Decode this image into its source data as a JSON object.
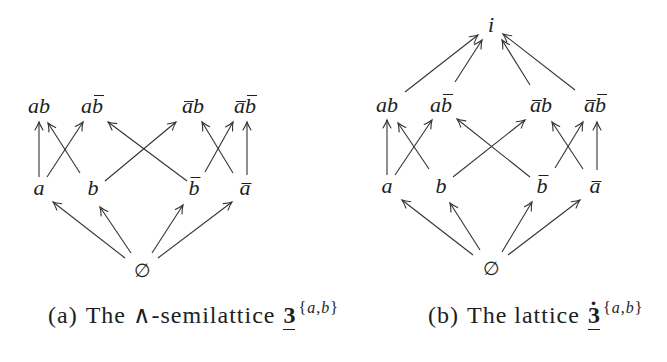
{
  "subfigures": [
    {
      "caption": {
        "tag": "(a)",
        "text": "The ∧-semilattice",
        "symbol": "3",
        "symbol_style": "bold, underlined",
        "superscript": [
          "{",
          "a",
          ",",
          "b",
          "}"
        ]
      },
      "nodes": {
        "ab": {
          "label": "ab",
          "parts": [
            "a",
            "b"
          ],
          "overline": [
            false,
            false
          ]
        },
        "a_bbar": {
          "label": "ab̄",
          "parts": [
            "a",
            "b"
          ],
          "overline": [
            false,
            true
          ]
        },
        "abar_b": {
          "label": "āb",
          "parts": [
            "a",
            "b"
          ],
          "overline": [
            true,
            false
          ]
        },
        "abar_bbar": {
          "label": "āb̄",
          "parts": [
            "a",
            "b"
          ],
          "overline": [
            true,
            true
          ]
        },
        "a": {
          "label": "a",
          "parts": [
            "a"
          ],
          "overline": [
            false
          ]
        },
        "b": {
          "label": "b",
          "parts": [
            "b"
          ],
          "overline": [
            false
          ]
        },
        "bbar": {
          "label": "b̄",
          "parts": [
            "b"
          ],
          "overline": [
            true
          ]
        },
        "abar": {
          "label": "ā",
          "parts": [
            "a"
          ],
          "overline": [
            true
          ]
        },
        "bottom": {
          "label": "∅",
          "parts": [
            "∅"
          ]
        }
      },
      "edges": [
        [
          "a",
          "ab"
        ],
        [
          "a",
          "a_bbar"
        ],
        [
          "b",
          "ab"
        ],
        [
          "b",
          "abar_b"
        ],
        [
          "bbar",
          "a_bbar"
        ],
        [
          "bbar",
          "abar_bbar"
        ],
        [
          "abar",
          "abar_b"
        ],
        [
          "abar",
          "abar_bbar"
        ],
        [
          "bottom",
          "a"
        ],
        [
          "bottom",
          "b"
        ],
        [
          "bottom",
          "bbar"
        ],
        [
          "bottom",
          "abar"
        ]
      ]
    },
    {
      "caption": {
        "tag": "(b)",
        "text": "The lattice",
        "symbol": "3",
        "symbol_accent": "˙",
        "symbol_style": "bold, underlined, dot above",
        "superscript": [
          "{",
          "a",
          ",",
          "b",
          "}"
        ]
      },
      "nodes": {
        "top": {
          "label": "i",
          "parts": [
            "i"
          ]
        },
        "ab": {
          "label": "ab",
          "parts": [
            "a",
            "b"
          ],
          "overline": [
            false,
            false
          ]
        },
        "a_bbar": {
          "label": "ab̄",
          "parts": [
            "a",
            "b"
          ],
          "overline": [
            false,
            true
          ]
        },
        "abar_b": {
          "label": "āb",
          "parts": [
            "a",
            "b"
          ],
          "overline": [
            true,
            false
          ]
        },
        "abar_bbar": {
          "label": "āb̄",
          "parts": [
            "a",
            "b"
          ],
          "overline": [
            true,
            true
          ]
        },
        "a": {
          "label": "a",
          "parts": [
            "a"
          ],
          "overline": [
            false
          ]
        },
        "b": {
          "label": "b",
          "parts": [
            "b"
          ],
          "overline": [
            false
          ]
        },
        "bbar": {
          "label": "b̄",
          "parts": [
            "b"
          ],
          "overline": [
            true
          ]
        },
        "abar": {
          "label": "ā",
          "parts": [
            "a"
          ],
          "overline": [
            true
          ]
        },
        "bottom": {
          "label": "∅",
          "parts": [
            "∅"
          ]
        }
      },
      "edges": [
        [
          "a",
          "ab"
        ],
        [
          "a",
          "a_bbar"
        ],
        [
          "b",
          "ab"
        ],
        [
          "b",
          "abar_b"
        ],
        [
          "bbar",
          "a_bbar"
        ],
        [
          "bbar",
          "abar_bbar"
        ],
        [
          "abar",
          "abar_b"
        ],
        [
          "abar",
          "abar_bbar"
        ],
        [
          "bottom",
          "a"
        ],
        [
          "bottom",
          "b"
        ],
        [
          "bottom",
          "bbar"
        ],
        [
          "bottom",
          "abar"
        ],
        [
          "ab",
          "top"
        ],
        [
          "a_bbar",
          "top"
        ],
        [
          "abar_b",
          "top"
        ],
        [
          "abar_bbar",
          "top"
        ]
      ]
    }
  ],
  "colors": {
    "background": "#ffffff",
    "text": "#1e1e1e",
    "edge": "#333333"
  }
}
